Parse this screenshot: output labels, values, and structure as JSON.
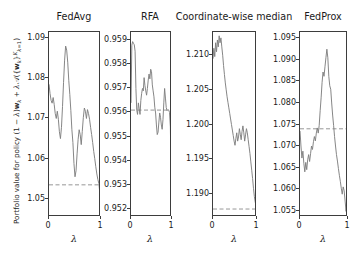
{
  "figure": {
    "ylabel_text": "Portfolio value for policy (1 - λ)w_k + λ A({w_k}_{k=1}^{K})",
    "xlabel": "λ",
    "line_color": "#7f7f7f",
    "dashed_color": "#8a8a8a",
    "axis_color": "#3d3d3d"
  },
  "chart_data": [
    {
      "type": "line",
      "title": "FedAvg",
      "xlabel": "λ",
      "ylabel": "Portfolio value for policy (1 − λ)w_k + λA({w_k}_{k=1}^K)",
      "xlim": [
        0,
        1
      ],
      "ylim": [
        1.0455,
        1.0915
      ],
      "xticks": [
        0,
        1
      ],
      "xticklabels": [
        "0",
        "1"
      ],
      "yticks": [
        1.05,
        1.06,
        1.07,
        1.08,
        1.09
      ],
      "yticklabels": [
        "1.05",
        "1.06",
        "1.07",
        "1.08",
        "1.09"
      ],
      "grid": false,
      "legend": "none",
      "hline": 1.0535,
      "hline_style": "dashed",
      "x": [
        0.0,
        0.02,
        0.04,
        0.06,
        0.08,
        0.1,
        0.12,
        0.14,
        0.16,
        0.18,
        0.2,
        0.22,
        0.24,
        0.26,
        0.28,
        0.3,
        0.32,
        0.34,
        0.36,
        0.38,
        0.4,
        0.42,
        0.44,
        0.46,
        0.48,
        0.5,
        0.52,
        0.54,
        0.56,
        0.58,
        0.6,
        0.62,
        0.64,
        0.66,
        0.68,
        0.7,
        0.72,
        0.74,
        0.76,
        0.78,
        0.8,
        0.82,
        0.84,
        0.86,
        0.88,
        0.9,
        0.92,
        0.94,
        0.96,
        0.98,
        1.0
      ],
      "y": [
        1.0785,
        1.0762,
        1.0745,
        1.0738,
        1.0752,
        1.0735,
        1.0712,
        1.07,
        1.0718,
        1.0698,
        1.0667,
        1.065,
        1.0678,
        1.073,
        1.079,
        1.0845,
        1.088,
        1.087,
        1.084,
        1.0795,
        1.076,
        1.072,
        1.0672,
        1.064,
        1.0588,
        1.0555,
        1.057,
        1.0612,
        1.0648,
        1.0672,
        1.066,
        1.0635,
        1.0668,
        1.0702,
        1.0726,
        1.0718,
        1.07,
        1.0722,
        1.0712,
        1.0698,
        1.0678,
        1.066,
        1.064,
        1.0618,
        1.06,
        1.058,
        1.0562,
        1.0548,
        1.0538,
        1.051,
        1.0465
      ]
    },
    {
      "type": "line",
      "title": "RFA",
      "xlabel": "λ",
      "xlim": [
        0,
        1
      ],
      "ylim": [
        0.95165,
        0.95935
      ],
      "xticks": [
        0,
        1
      ],
      "xticklabels": [
        "0",
        "1"
      ],
      "yticks": [
        0.952,
        0.953,
        0.954,
        0.955,
        0.956,
        0.957,
        0.958,
        0.959
      ],
      "yticklabels": [
        "0.952",
        "0.953",
        "0.954",
        "0.955",
        "0.956",
        "0.957",
        "0.958",
        "0.959"
      ],
      "grid": false,
      "legend": "none",
      "hline": 0.9561,
      "hline_style": "dashed",
      "x": [
        0.0,
        0.02,
        0.04,
        0.06,
        0.08,
        0.1,
        0.12,
        0.14,
        0.16,
        0.18,
        0.2,
        0.22,
        0.24,
        0.26,
        0.28,
        0.3,
        0.32,
        0.34,
        0.36,
        0.38,
        0.4,
        0.42,
        0.44,
        0.46,
        0.48,
        0.5,
        0.52,
        0.54,
        0.56,
        0.58,
        0.6,
        0.62,
        0.64,
        0.66,
        0.68,
        0.7,
        0.72,
        0.74,
        0.76,
        0.78,
        0.8,
        0.82,
        0.84,
        0.86,
        0.88,
        0.9,
        0.92,
        0.94,
        0.96,
        0.98,
        1.0
      ],
      "y": [
        0.9564,
        0.9588,
        0.95895,
        0.95888,
        0.95882,
        0.95855,
        0.957,
        0.9561,
        0.95592,
        0.9564,
        0.95615,
        0.95592,
        0.9565,
        0.9568,
        0.957,
        0.9569,
        0.95745,
        0.95712,
        0.9569,
        0.95672,
        0.957,
        0.95735,
        0.9576,
        0.9574,
        0.9578,
        0.9577,
        0.95715,
        0.9569,
        0.95665,
        0.95622,
        0.95598,
        0.95548,
        0.95508,
        0.95518,
        0.9556,
        0.95598,
        0.9558,
        0.95548,
        0.9553,
        0.9557,
        0.9564,
        0.957,
        0.9566,
        0.9562,
        0.95608,
        0.95612,
        0.9561,
        0.956,
        0.9554,
        0.9532,
        0.95215
      ]
    },
    {
      "type": "line",
      "title": "Coordinate-wise median",
      "xlabel": "λ",
      "xlim": [
        0,
        1
      ],
      "ylim": [
        1.18665,
        1.21335
      ],
      "xticks": [
        0,
        1
      ],
      "xticklabels": [
        "0",
        "1"
      ],
      "yticks": [
        1.19,
        1.195,
        1.2,
        1.205,
        1.21
      ],
      "yticklabels": [
        "1.190",
        "1.195",
        "1.200",
        "1.205",
        "1.210"
      ],
      "grid": false,
      "legend": "none",
      "hline": 1.1878,
      "hline_style": "dashed",
      "x": [
        0.0,
        0.02,
        0.04,
        0.06,
        0.08,
        0.1,
        0.12,
        0.14,
        0.16,
        0.18,
        0.2,
        0.22,
        0.24,
        0.26,
        0.28,
        0.3,
        0.32,
        0.34,
        0.36,
        0.38,
        0.4,
        0.42,
        0.44,
        0.46,
        0.48,
        0.5,
        0.52,
        0.54,
        0.56,
        0.58,
        0.6,
        0.62,
        0.64,
        0.66,
        0.68,
        0.7,
        0.72,
        0.74,
        0.76,
        0.78,
        0.8,
        0.82,
        0.84,
        0.86,
        0.88,
        0.9,
        0.92,
        0.94,
        0.96,
        0.98,
        1.0
      ],
      "y": [
        1.2095,
        1.211,
        1.2098,
        1.2118,
        1.2105,
        1.2122,
        1.2112,
        1.2128,
        1.2118,
        1.2125,
        1.2112,
        1.21,
        1.2085,
        1.2072,
        1.206,
        1.205,
        1.204,
        1.2032,
        1.2024,
        1.2016,
        1.2008,
        1.2,
        1.1992,
        1.1984,
        1.1976,
        1.197,
        1.198,
        1.1988,
        1.1976,
        1.1982,
        1.1994,
        1.1986,
        1.1978,
        1.199,
        1.1998,
        1.1988,
        1.1976,
        1.1985,
        1.1994,
        1.1988,
        1.1978,
        1.1968,
        1.1958,
        1.1946,
        1.1934,
        1.1922,
        1.1908,
        1.1896,
        1.1888,
        1.1882,
        1.1892
      ]
    },
    {
      "type": "line",
      "title": "FedProx",
      "xlabel": "λ",
      "xlim": [
        0,
        1
      ],
      "ylim": [
        1.0535,
        1.0965
      ],
      "xticks": [
        0,
        1
      ],
      "xticklabels": [
        "0",
        "1"
      ],
      "yticks": [
        1.055,
        1.06,
        1.065,
        1.07,
        1.075,
        1.08,
        1.085,
        1.09,
        1.095
      ],
      "yticklabels": [
        "1.055",
        "1.060",
        "1.065",
        "1.070",
        "1.075",
        "1.080",
        "1.085",
        "1.090",
        "1.095"
      ],
      "grid": false,
      "legend": "none",
      "hline": 1.074,
      "hline_style": "dashed",
      "x": [
        0.0,
        0.02,
        0.04,
        0.06,
        0.08,
        0.1,
        0.12,
        0.14,
        0.16,
        0.18,
        0.2,
        0.22,
        0.24,
        0.26,
        0.28,
        0.3,
        0.32,
        0.34,
        0.36,
        0.38,
        0.4,
        0.42,
        0.44,
        0.46,
        0.48,
        0.5,
        0.52,
        0.54,
        0.56,
        0.58,
        0.6,
        0.62,
        0.64,
        0.66,
        0.68,
        0.7,
        0.72,
        0.74,
        0.76,
        0.78,
        0.8,
        0.82,
        0.84,
        0.86,
        0.88,
        0.9,
        0.92,
        0.94,
        0.96,
        0.98,
        1.0
      ],
      "y": [
        1.0735,
        1.07,
        1.0672,
        1.0688,
        1.066,
        1.064,
        1.0662,
        1.0645,
        1.0668,
        1.068,
        1.0664,
        1.0682,
        1.07,
        1.0692,
        1.071,
        1.0722,
        1.0712,
        1.073,
        1.0742,
        1.073,
        1.0748,
        1.0782,
        1.0812,
        1.0848,
        1.0872,
        1.0862,
        1.0884,
        1.0905,
        1.0925,
        1.0905,
        1.0862,
        1.084,
        1.0832,
        1.08,
        1.0772,
        1.0748,
        1.0722,
        1.07,
        1.068,
        1.0665,
        1.0648,
        1.0632,
        1.0618,
        1.0602,
        1.0588,
        1.0605,
        1.0596,
        1.0572,
        1.0548,
        1.0582,
        1.0598
      ]
    }
  ],
  "panels": [
    {
      "title": "FedAvg",
      "box": {
        "left": 48,
        "top": 31,
        "width": 52,
        "height": 185
      },
      "title_center": 74,
      "title_top": 11,
      "yticklabel_right": 45,
      "xlabel_center": 74
    },
    {
      "title": "RFA",
      "box": {
        "left": 130,
        "top": 31,
        "width": 41,
        "height": 185
      },
      "title_center": 150,
      "title_top": 11,
      "yticklabel_right": 127,
      "xlabel_center": 150
    },
    {
      "title": "Coordinate-wise median",
      "box": {
        "left": 212,
        "top": 31,
        "width": 44,
        "height": 185
      },
      "title_center": 234,
      "title_top": 11,
      "yticklabel_right": 209,
      "xlabel_center": 234
    },
    {
      "title": "FedProx",
      "box": {
        "left": 299,
        "top": 31,
        "width": 48,
        "height": 185
      },
      "title_center": 323,
      "title_top": 11,
      "yticklabel_right": 296,
      "xlabel_center": 323
    }
  ]
}
